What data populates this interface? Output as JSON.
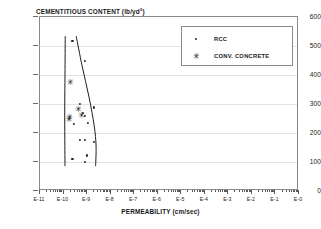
{
  "chart_data": {
    "type": "scatter",
    "title": "",
    "ylabel": "CEMENTITIOUS CONTENT (lb/yd",
    "ylabel_sup": "3",
    "ylabel_suffix": ")",
    "xlabel": "PERMEABILITY (cm/sec)",
    "ylim": [
      0,
      600
    ],
    "yticks": [
      0,
      100,
      200,
      300,
      400,
      500,
      600
    ],
    "ytick_labels": [
      "0",
      "100",
      "200",
      "300",
      "400",
      "500",
      "600"
    ],
    "xlim": [
      -11,
      0
    ],
    "xscale": "log",
    "xticks": [
      -11,
      -10,
      -9,
      -8,
      -7,
      -6,
      -5,
      -4,
      -3,
      -2,
      -1,
      0
    ],
    "xtick_labels": [
      "E-11",
      "E-10",
      "E-9",
      "E-8",
      "E-7",
      "E-6",
      "E-5",
      "E-4",
      "E-3",
      "E-2",
      "E-1",
      "E-0"
    ],
    "grid": "horizontal",
    "legend_position": "top-right",
    "legend": [
      {
        "label": "RCC",
        "marker": "dot"
      },
      {
        "label": "CONV. CONCRETE",
        "marker": "asterisk"
      }
    ],
    "series": [
      {
        "name": "RCC",
        "marker": "dot",
        "points": [
          {
            "x": -9.62,
            "y": 517
          },
          {
            "x": -9.1,
            "y": 448
          },
          {
            "x": -9.3,
            "y": 301
          },
          {
            "x": -8.72,
            "y": 288
          },
          {
            "x": -9.18,
            "y": 268
          },
          {
            "x": -9.08,
            "y": 258
          },
          {
            "x": -9.55,
            "y": 231
          },
          {
            "x": -8.97,
            "y": 236
          },
          {
            "x": -9.3,
            "y": 176
          },
          {
            "x": -9.1,
            "y": 176
          },
          {
            "x": -8.72,
            "y": 170
          },
          {
            "x": -9.02,
            "y": 123
          },
          {
            "x": -9.1,
            "y": 100
          },
          {
            "x": -9.62,
            "y": 110
          }
        ]
      },
      {
        "name": "CONV. CONCRETE",
        "marker": "asterisk",
        "points": [
          {
            "x": -9.72,
            "y": 376
          },
          {
            "x": -9.38,
            "y": 283
          },
          {
            "x": -9.25,
            "y": 262
          },
          {
            "x": -9.75,
            "y": 256
          },
          {
            "x": -9.78,
            "y": 249
          }
        ]
      }
    ],
    "envelope_curves": [
      {
        "name": "left-boundary",
        "points": [
          {
            "x": -9.92,
            "y": 533
          },
          {
            "x": -9.93,
            "y": 400
          },
          {
            "x": -9.94,
            "y": 300
          },
          {
            "x": -9.94,
            "y": 200
          },
          {
            "x": -9.93,
            "y": 80
          }
        ]
      },
      {
        "name": "right-boundary",
        "points": [
          {
            "x": -9.45,
            "y": 533
          },
          {
            "x": -9.2,
            "y": 430
          },
          {
            "x": -8.9,
            "y": 320
          },
          {
            "x": -8.68,
            "y": 220
          },
          {
            "x": -8.6,
            "y": 150
          },
          {
            "x": -8.62,
            "y": 80
          }
        ]
      }
    ]
  }
}
